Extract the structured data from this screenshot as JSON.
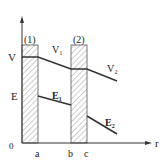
{
  "diagram": {
    "axes": {
      "y_label_top": "V",
      "y_label_mid": "E",
      "origin": "0",
      "x_label": "r",
      "x_ticks": [
        "a",
        "b",
        "c"
      ]
    },
    "regions": [
      {
        "label": "(1)",
        "from": "0",
        "to": "a"
      },
      {
        "label": "(2)",
        "from": "b",
        "to": "c"
      }
    ],
    "curves": {
      "V1": "V₁",
      "V2": "V₂",
      "E1": "E₁",
      "E2": "E₂"
    },
    "colors": {
      "line": "#333333",
      "hatch": "#888888"
    }
  }
}
